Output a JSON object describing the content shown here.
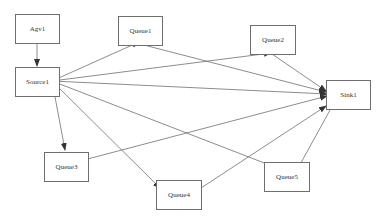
{
  "diagram": {
    "type": "directed-graph",
    "edge_color": "#6e6e6e",
    "node_border_color": "#6e6e6e",
    "nodes": [
      {
        "id": "Agv1",
        "label": "Agv1",
        "x": 15,
        "y": 14,
        "w": 45,
        "h": 30
      },
      {
        "id": "Source1",
        "label": "Source1",
        "x": 15,
        "y": 67,
        "w": 45,
        "h": 30
      },
      {
        "id": "Queue1",
        "label": "Queue1",
        "x": 118,
        "y": 16,
        "w": 45,
        "h": 30
      },
      {
        "id": "Queue2",
        "label": "Queue2",
        "x": 250,
        "y": 25,
        "w": 46,
        "h": 30
      },
      {
        "id": "Sink1",
        "label": "Sink1",
        "x": 326,
        "y": 80,
        "w": 45,
        "h": 30
      },
      {
        "id": "Queue3",
        "label": "Queue3",
        "x": 44,
        "y": 152,
        "w": 45,
        "h": 30
      },
      {
        "id": "Queue4",
        "label": "Queue4",
        "x": 156,
        "y": 180,
        "w": 46,
        "h": 30
      },
      {
        "id": "Queue5",
        "label": "Queue5",
        "x": 264,
        "y": 162,
        "w": 46,
        "h": 30
      }
    ],
    "edges": [
      {
        "from": "Agv1",
        "to": "Source1",
        "x1": 37,
        "y1": 44,
        "x2": 37,
        "y2": 66
      },
      {
        "from": "Source1",
        "to": "Queue1",
        "x1": 52,
        "y1": 81,
        "x2": 139,
        "y2": 42
      },
      {
        "from": "Source1",
        "to": "Queue2",
        "x1": 52,
        "y1": 81,
        "x2": 271,
        "y2": 53
      },
      {
        "from": "Source1",
        "to": "Sink1",
        "x1": 52,
        "y1": 81,
        "x2": 327,
        "y2": 94
      },
      {
        "from": "Source1",
        "to": "Queue3",
        "x1": 52,
        "y1": 81,
        "x2": 65,
        "y2": 150
      },
      {
        "from": "Source1",
        "to": "Queue4",
        "x1": 52,
        "y1": 81,
        "x2": 160,
        "y2": 188
      },
      {
        "from": "Source1",
        "to": "Queue5",
        "x1": 52,
        "y1": 81,
        "x2": 285,
        "y2": 171
      },
      {
        "from": "Queue1",
        "to": "Sink1",
        "x1": 140,
        "y1": 44,
        "x2": 326,
        "y2": 92
      },
      {
        "from": "Queue2",
        "to": "Sink1",
        "x1": 272,
        "y1": 54,
        "x2": 326,
        "y2": 91
      },
      {
        "from": "Queue3",
        "to": "Sink1",
        "x1": 80,
        "y1": 161,
        "x2": 327,
        "y2": 96
      },
      {
        "from": "Queue4",
        "to": "Sink1",
        "x1": 201,
        "y1": 188,
        "x2": 326,
        "y2": 106
      },
      {
        "from": "Queue5",
        "to": "Sink1",
        "x1": 297,
        "y1": 170,
        "x2": 335,
        "y2": 101
      }
    ]
  }
}
